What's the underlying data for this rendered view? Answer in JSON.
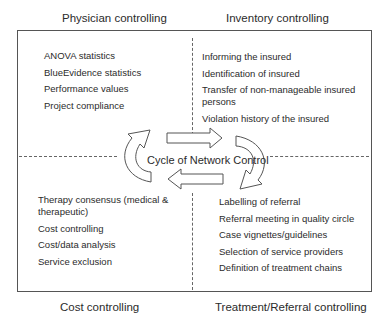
{
  "diagram": {
    "center_label": "Cycle of Network Control",
    "quadrants": {
      "top_left": {
        "title": "Physician controlling",
        "items": [
          "ANOVA statistics",
          "BlueEvidence statistics",
          "Performance values",
          "Project compliance"
        ]
      },
      "top_right": {
        "title": "Inventory controlling",
        "items": [
          "Informing the insured",
          "Identification of insured",
          "Transfer of non-manageable insured persons",
          "Violation history of the insured"
        ]
      },
      "bottom_left": {
        "title": "Cost controlling",
        "items": [
          "Therapy consensus (medical & therapeutic)",
          "Cost controlling",
          "Cost/data analysis",
          "Service exclusion"
        ]
      },
      "bottom_right": {
        "title": "Treatment/Referral controlling",
        "items": [
          "Labelling of referral",
          "Referral meeting in quality circle",
          "Case vignettes/guidelines",
          "Selection of service providers",
          "Definition of treatment chains"
        ]
      }
    },
    "arrows": [
      {
        "name": "top-arrow",
        "direction": "right"
      },
      {
        "name": "right-curved-arrow",
        "direction": "clockwise-down"
      },
      {
        "name": "bottom-arrow",
        "direction": "left"
      },
      {
        "name": "left-curved-arrow",
        "direction": "clockwise-up"
      }
    ],
    "colors": {
      "line": "#555555",
      "text": "#2b2b2b",
      "background": "#ffffff"
    }
  }
}
